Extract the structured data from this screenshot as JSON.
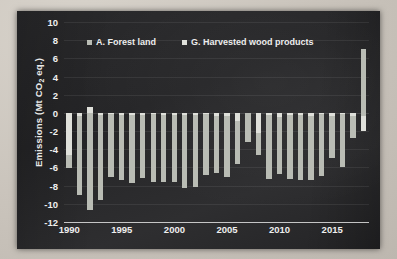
{
  "chart_data": {
    "type": "bar",
    "subtype": "stacked-column",
    "title": "",
    "xlabel": "",
    "ylabel": "Emissions (Mt CO₂ eq.)",
    "ylabel_prefix": "Emissions (Mt CO",
    "ylabel_sub": "2",
    "ylabel_suffix": " eq.)",
    "ylim": [
      -12,
      10
    ],
    "ytick_step": 2,
    "yticks": [
      10,
      8,
      6,
      4,
      2,
      0,
      -2,
      -4,
      -6,
      -8,
      -10,
      -12
    ],
    "ytick_labels": [
      "10",
      "8",
      "6",
      "4",
      "2",
      "0",
      "-2",
      "-4",
      "-6",
      "-8",
      "-10",
      "-12"
    ],
    "xlim": [
      1989.5,
      2018.5
    ],
    "xticks": [
      1990,
      1995,
      2000,
      2005,
      2010,
      2015
    ],
    "xtick_labels": [
      "1990",
      "1995",
      "2000",
      "2005",
      "2010",
      "2015"
    ],
    "grid": true,
    "legend_position": "top-center",
    "categories": [
      1990,
      1991,
      1992,
      1993,
      1994,
      1995,
      1996,
      1997,
      1998,
      1999,
      2000,
      2001,
      2002,
      2003,
      2004,
      2005,
      2006,
      2007,
      2008,
      2009,
      2010,
      2011,
      2012,
      2013,
      2014,
      2015,
      2016,
      2017,
      2018
    ],
    "series": [
      {
        "name": "A.  Forest land",
        "key": "forest",
        "color": "#b9bcb4",
        "values": [
          -4.6,
          -9.0,
          -10.7,
          -9.6,
          -7.1,
          -7.4,
          -7.7,
          -7.2,
          -7.6,
          -7.6,
          -7.6,
          -8.3,
          -8.1,
          -6.8,
          -6.6,
          -7.1,
          -5.6,
          -3.2,
          -4.6,
          -7.3,
          -6.7,
          -7.3,
          -7.4,
          -7.4,
          -6.9,
          -5.0,
          -5.9,
          -2.8,
          7.0
        ]
      },
      {
        "name": "G.  Harvested wood products",
        "key": "hwp",
        "color": "#dfe0da",
        "values": [
          -1.5,
          -0.3,
          0.6,
          -0.2,
          -0.1,
          -0.2,
          -0.2,
          -0.2,
          -0.1,
          -0.2,
          -0.2,
          -0.2,
          -0.2,
          -0.1,
          -0.3,
          -0.3,
          -0.9,
          0.0,
          -2.2,
          -0.2,
          -0.5,
          -0.2,
          -0.2,
          -0.3,
          -0.1,
          -0.3,
          -0.1,
          -0.3,
          -2.0
        ]
      }
    ],
    "bar_segments": [
      {
        "year": 1990,
        "forest_from": -4.6,
        "forest_to": -6.1,
        "hwp_from": 0,
        "hwp_to": -4.6
      },
      {
        "year": 1991,
        "forest_from": -0.3,
        "forest_to": -9.0,
        "hwp_from": 0,
        "hwp_to": -0.3
      },
      {
        "year": 1992,
        "forest_from": 0.6,
        "forest_to": -10.7,
        "hwp_from": 0.6,
        "hwp_to": 0
      },
      {
        "year": 1993,
        "forest_from": -0.2,
        "forest_to": -9.6,
        "hwp_from": 0,
        "hwp_to": -0.2
      },
      {
        "year": 1994,
        "forest_from": -0.1,
        "forest_to": -7.1,
        "hwp_from": 0,
        "hwp_to": -0.1
      },
      {
        "year": 1995,
        "forest_from": -0.2,
        "forest_to": -7.4,
        "hwp_from": 0,
        "hwp_to": -0.2
      },
      {
        "year": 1996,
        "forest_from": -0.2,
        "forest_to": -7.7,
        "hwp_from": 0,
        "hwp_to": -0.2
      },
      {
        "year": 1997,
        "forest_from": -0.2,
        "forest_to": -7.2,
        "hwp_from": 0,
        "hwp_to": -0.2
      },
      {
        "year": 1998,
        "forest_from": -0.1,
        "forest_to": -7.6,
        "hwp_from": 0,
        "hwp_to": -0.1
      },
      {
        "year": 1999,
        "forest_from": -0.2,
        "forest_to": -7.6,
        "hwp_from": 0,
        "hwp_to": -0.2
      },
      {
        "year": 2000,
        "forest_from": -0.2,
        "forest_to": -7.6,
        "hwp_from": 0,
        "hwp_to": -0.2
      },
      {
        "year": 2001,
        "forest_from": -0.2,
        "forest_to": -8.3,
        "hwp_from": 0,
        "hwp_to": -0.2
      },
      {
        "year": 2002,
        "forest_from": -0.2,
        "forest_to": -8.1,
        "hwp_from": 0,
        "hwp_to": -0.2
      },
      {
        "year": 2003,
        "forest_from": -0.1,
        "forest_to": -6.8,
        "hwp_from": 0,
        "hwp_to": -0.1
      },
      {
        "year": 2004,
        "forest_from": -0.3,
        "forest_to": -6.6,
        "hwp_from": 0,
        "hwp_to": -0.3
      },
      {
        "year": 2005,
        "forest_from": -0.3,
        "forest_to": -7.1,
        "hwp_from": 0,
        "hwp_to": -0.3
      },
      {
        "year": 2006,
        "forest_from": -0.9,
        "forest_to": -5.6,
        "hwp_from": 0,
        "hwp_to": -0.9
      },
      {
        "year": 2007,
        "forest_from": 0.0,
        "forest_to": -3.2,
        "hwp_from": 0,
        "hwp_to": 0
      },
      {
        "year": 2008,
        "forest_from": -2.2,
        "forest_to": -4.6,
        "hwp_from": 0,
        "hwp_to": -2.2
      },
      {
        "year": 2009,
        "forest_from": -0.2,
        "forest_to": -7.3,
        "hwp_from": 0,
        "hwp_to": -0.2
      },
      {
        "year": 2010,
        "forest_from": -0.5,
        "forest_to": -6.7,
        "hwp_from": 0,
        "hwp_to": -0.5
      },
      {
        "year": 2011,
        "forest_from": -0.2,
        "forest_to": -7.3,
        "hwp_from": 0,
        "hwp_to": -0.2
      },
      {
        "year": 2012,
        "forest_from": -0.2,
        "forest_to": -7.4,
        "hwp_from": 0,
        "hwp_to": -0.2
      },
      {
        "year": 2013,
        "forest_from": -0.3,
        "forest_to": -7.4,
        "hwp_from": 0,
        "hwp_to": -0.3
      },
      {
        "year": 2014,
        "forest_from": -0.1,
        "forest_to": -6.9,
        "hwp_from": 0,
        "hwp_to": -0.1
      },
      {
        "year": 2015,
        "forest_from": -0.3,
        "forest_to": -5.0,
        "hwp_from": 0,
        "hwp_to": -0.3
      },
      {
        "year": 2016,
        "forest_from": -0.1,
        "forest_to": -5.9,
        "hwp_from": 0,
        "hwp_to": -0.1
      },
      {
        "year": 2017,
        "forest_from": -0.3,
        "forest_to": -2.8,
        "hwp_from": 0,
        "hwp_to": -0.3
      },
      {
        "year": 2018,
        "forest_from": 7.0,
        "forest_to": -0.3,
        "hwp_from": -0.3,
        "hwp_to": -2.0
      }
    ]
  },
  "legend": {
    "items": [
      {
        "label": "A.  Forest land",
        "swatch_class": "sw-forest"
      },
      {
        "label": "G.  Harvested wood products",
        "swatch_class": "sw-hwp"
      }
    ]
  },
  "colors": {
    "panel_background": "#2a2a2c",
    "page_background": "#cfcac2",
    "series_forest": "#b9bcb4",
    "series_hwp": "#dfe0da",
    "axis_text": "#efefef",
    "gridline": "rgba(255,255,255,0.075)"
  }
}
